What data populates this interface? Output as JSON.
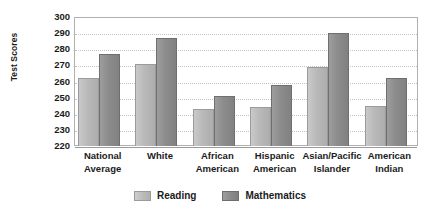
{
  "chart_data": {
    "type": "bar",
    "title": "",
    "xlabel": "",
    "ylabel": "Test Scores",
    "ylim": [
      220,
      300
    ],
    "ytick_step": 10,
    "yticks": [
      300,
      290,
      280,
      270,
      260,
      250,
      240,
      230,
      220
    ],
    "grid": true,
    "legend_position": "bottom",
    "categories": [
      "National Average",
      "White",
      "African American",
      "Hispanic American",
      "Asian/Pacific Islander",
      "American Indian"
    ],
    "category_lines": [
      [
        "National",
        "Average"
      ],
      [
        "White",
        ""
      ],
      [
        "African",
        "American"
      ],
      [
        "Hispanic",
        "American"
      ],
      [
        "Asian/Pacific",
        "Islander"
      ],
      [
        "American",
        "Indian"
      ]
    ],
    "series": [
      {
        "name": "Reading",
        "color": "#b9b9b9",
        "values": [
          262,
          271,
          243,
          244,
          269,
          245
        ]
      },
      {
        "name": "Mathematics",
        "color": "#8c8c8c",
        "values": [
          277,
          287,
          251,
          258,
          290,
          262
        ]
      }
    ]
  },
  "legend": {
    "items": [
      {
        "label": "Reading",
        "color": "#b9b9b9"
      },
      {
        "label": "Mathematics",
        "color": "#8c8c8c"
      }
    ]
  },
  "colors": {
    "reading": "#b9b9b9",
    "mathematics": "#8c8c8c",
    "gridline": "#c2c2c2",
    "frame": "#b0b0b0",
    "text": "#1b1b1b",
    "background": "#ffffff"
  }
}
